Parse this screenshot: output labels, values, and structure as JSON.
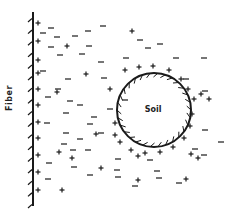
{
  "labels": {
    "fiber": "Fiber",
    "soil": "Soil"
  },
  "colors": {
    "ink": "#1a1a1a",
    "background": "#ffffff"
  },
  "fiber": {
    "x": 33,
    "y_top": 12,
    "y_bottom": 206,
    "hatch_count": 17
  },
  "soil_particle": {
    "cx": 154,
    "cy": 110,
    "r": 37,
    "hatch_count": 30
  },
  "charges": {
    "fiber_surface_plus": [
      [
        38,
        23
      ],
      [
        38,
        41
      ],
      [
        38,
        60
      ],
      [
        38,
        73
      ],
      [
        38,
        89
      ],
      [
        38,
        105
      ],
      [
        38,
        122
      ],
      [
        38,
        138
      ],
      [
        38,
        155
      ],
      [
        38,
        172
      ],
      [
        38,
        190
      ]
    ],
    "field_plus": [
      [
        67,
        46
      ],
      [
        86,
        74
      ],
      [
        57,
        92
      ],
      [
        110,
        89
      ],
      [
        72,
        158
      ],
      [
        101,
        168
      ],
      [
        62,
        190
      ],
      [
        132,
        31
      ],
      [
        186,
        179
      ],
      [
        138,
        180
      ],
      [
        138,
        156
      ],
      [
        59,
        152
      ],
      [
        96,
        134
      ],
      [
        115,
        123
      ]
    ],
    "field_minus": [
      [
        51,
        28
      ],
      [
        43,
        33
      ],
      [
        57,
        37
      ],
      [
        75,
        36
      ],
      [
        88,
        31
      ],
      [
        103,
        26
      ],
      [
        51,
        47
      ],
      [
        89,
        46
      ],
      [
        60,
        55
      ],
      [
        82,
        54
      ],
      [
        101,
        62
      ],
      [
        43,
        71
      ],
      [
        68,
        79
      ],
      [
        104,
        78
      ],
      [
        58,
        89
      ],
      [
        48,
        97
      ],
      [
        70,
        101
      ],
      [
        80,
        105
      ],
      [
        66,
        113
      ],
      [
        94,
        117
      ],
      [
        47,
        123
      ],
      [
        90,
        124
      ],
      [
        66,
        133
      ],
      [
        80,
        139
      ],
      [
        101,
        133
      ],
      [
        64,
        144
      ],
      [
        73,
        150
      ],
      [
        88,
        150
      ],
      [
        49,
        163
      ],
      [
        74,
        167
      ],
      [
        90,
        175
      ],
      [
        48,
        179
      ],
      [
        140,
        40
      ],
      [
        148,
        48
      ],
      [
        160,
        44
      ],
      [
        126,
        58
      ],
      [
        176,
        58
      ],
      [
        186,
        79
      ],
      [
        204,
        58
      ],
      [
        205,
        91
      ],
      [
        195,
        149
      ],
      [
        204,
        155
      ],
      [
        221,
        142
      ],
      [
        205,
        130
      ],
      [
        118,
        159
      ],
      [
        118,
        177
      ],
      [
        157,
        171
      ],
      [
        150,
        160
      ],
      [
        159,
        178
      ],
      [
        135,
        186
      ],
      [
        179,
        183
      ],
      [
        117,
        170
      ],
      [
        125,
        100
      ],
      [
        110,
        109
      ]
    ],
    "soil_surface_plus": [
      [
        125,
        70
      ],
      [
        139,
        67
      ],
      [
        153,
        66
      ],
      [
        169,
        70
      ],
      [
        181,
        79
      ],
      [
        188,
        89
      ],
      [
        194,
        99
      ],
      [
        192,
        114
      ],
      [
        190,
        126
      ],
      [
        184,
        138
      ],
      [
        173,
        147
      ],
      [
        160,
        152
      ],
      [
        145,
        153
      ],
      [
        131,
        150
      ],
      [
        120,
        142
      ],
      [
        115,
        135
      ],
      [
        201,
        94
      ],
      [
        209,
        99
      ],
      [
        191,
        154
      ],
      [
        198,
        158
      ]
    ]
  }
}
